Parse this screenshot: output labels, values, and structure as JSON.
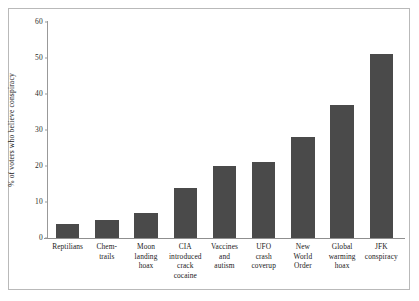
{
  "chart_data": {
    "type": "bar",
    "title": "",
    "subtitle": "",
    "xlabel": "",
    "ylabel": "% of voters who believe conspiracy",
    "ylim": [
      0,
      60
    ],
    "yticks": [
      0,
      10,
      20,
      30,
      40,
      50,
      60
    ],
    "ytick_labels": [
      "0",
      "10",
      "20",
      "30",
      "40",
      "50",
      "60"
    ],
    "grid": false,
    "legend": null,
    "bar_color": "#4a4a4a",
    "categories": [
      "Reptilians",
      "Chemtrails",
      "Moon landing hoax",
      "CIA introduced crack cocaine",
      "Vaccines and autism",
      "UFO crash coverup",
      "New World Order",
      "Global warming hoax",
      "JFK conspiracy"
    ],
    "category_lines": [
      [
        "Reptilians"
      ],
      [
        "Chem-",
        "trails"
      ],
      [
        "Moon",
        "landing",
        "hoax"
      ],
      [
        "CIA",
        "introduced",
        "crack",
        "cocaine"
      ],
      [
        "Vaccines",
        "and",
        "autism"
      ],
      [
        "UFO",
        "crash",
        "coverup"
      ],
      [
        "New",
        "World",
        "Order"
      ],
      [
        "Global",
        "warming",
        "hoax"
      ],
      [
        "JFK",
        "conspiracy"
      ]
    ],
    "values": [
      4,
      5,
      7,
      14,
      20,
      21,
      28,
      37,
      51
    ]
  },
  "figure": {
    "border_color": "#b9b9b9",
    "background": "#ffffff",
    "axis_color": "#999999"
  }
}
